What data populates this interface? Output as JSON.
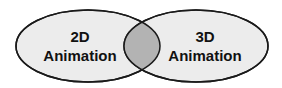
{
  "diagram": {
    "type": "venn",
    "sets": [
      {
        "id": "left",
        "line1": "2D",
        "line2": "Animation"
      },
      {
        "id": "right",
        "line1": "3D",
        "line2": "Animation"
      }
    ],
    "colors": {
      "set_fill": "#ececec",
      "overlap_fill": "#b3b3b3",
      "stroke": "#1a1a1a"
    }
  }
}
